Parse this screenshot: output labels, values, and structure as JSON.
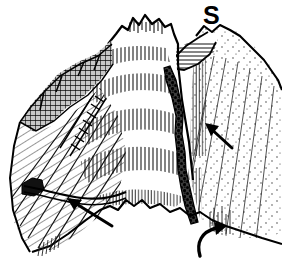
{
  "figure": {
    "kind": "geological-line-drawing",
    "title": "",
    "caption": "",
    "background_color": "#ffffff",
    "ink_color": "#000000",
    "width": 282,
    "height": 264
  },
  "labels": [
    {
      "id": "s",
      "text": "S",
      "x": 203,
      "y": 3,
      "font_size": 25,
      "bold": true
    }
  ],
  "annotations": {
    "arrows": [
      {
        "name": "lower-left-arrow",
        "style": "straight",
        "direction": "up-left",
        "tail": [
          112,
          226
        ],
        "head": [
          67,
          198
        ]
      },
      {
        "name": "right-slope-arrow",
        "style": "straight",
        "direction": "up-left",
        "tail": [
          232,
          148
        ],
        "head": [
          205,
          123
        ]
      },
      {
        "name": "bottom-curved-arrow",
        "style": "curved-hook",
        "direction": "up-right",
        "tail": [
          203,
          254
        ],
        "head": [
          227,
          228
        ]
      }
    ]
  },
  "features": {
    "main_peak": {
      "name": "central-stratified-peak",
      "texture": "vertical-hatching-bands",
      "band_count": 5
    },
    "left_ridge": {
      "name": "left-dark-rock-band",
      "texture": "dense-cross-hatching"
    },
    "left_slope": {
      "name": "left-diagonal-slope",
      "texture": "diagonal-hatching"
    },
    "fault": {
      "name": "central-dark-fault-gully",
      "texture": "dark-stipple-band"
    },
    "right_slope": {
      "name": "right-stippled-slope",
      "texture": "stipple-with-diagonal-lines"
    },
    "foreground": {
      "name": "foreground-talus-line",
      "texture": "irregular-outline"
    }
  }
}
